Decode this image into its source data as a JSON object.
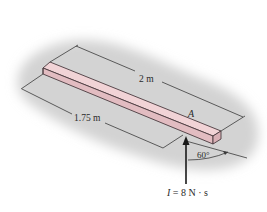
{
  "figure": {
    "type": "engineering-mechanics-diagram",
    "colors": {
      "background": "#ffffff",
      "surface_shadow": "#d4d4d4",
      "bar_top": "#f1d3d6",
      "bar_side": "#dcb3b8",
      "lines": "#3a3a3a"
    }
  },
  "labels": {
    "bar_length": "2 m",
    "distance_to_A": "1.75 m",
    "point": "A",
    "angle": "60°",
    "impulse_symbol": "I",
    "impulse_value": " = 8 N · s"
  }
}
